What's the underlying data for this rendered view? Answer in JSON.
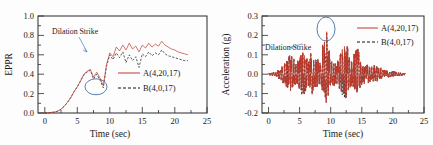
{
  "figure": {
    "panels": [
      {
        "id": "eppr-panel",
        "ylabel": "EPPR",
        "xlabel": "Time (sec)",
        "annotation": "Dilation Strike",
        "yticks": [
          "0.0",
          "0.2",
          "0.4",
          "0.6",
          "0.8",
          "1.0"
        ],
        "xticks": [
          "0",
          "5",
          "10",
          "15",
          "20",
          "25"
        ],
        "legend": [
          {
            "label": "A(4,20,17)",
            "style": "solid",
            "color": "#c0392b"
          },
          {
            "label": "B(4,0,17)",
            "style": "dashed",
            "color": "#111111"
          }
        ]
      },
      {
        "id": "acceleration-panel",
        "ylabel": "Acceleration (g)",
        "xlabel": "Time (sec)",
        "annotation": "Dilation Strike",
        "yticks": [
          "-0.2",
          "-0.1",
          "0.0",
          "0.1",
          "0.2",
          "0.3"
        ],
        "xticks": [
          "0",
          "5",
          "10",
          "15",
          "20",
          "25"
        ],
        "legend": [
          {
            "label": "A(4,20,17)",
            "style": "solid",
            "color": "#c0392b"
          },
          {
            "label": "B(4,0,17)",
            "style": "dashed",
            "color": "#111111"
          }
        ]
      }
    ]
  },
  "chart_data": [
    {
      "type": "line",
      "title": "",
      "xlabel": "Time (sec)",
      "ylabel": "EPPR",
      "xlim": [
        0,
        25
      ],
      "ylim": [
        0.0,
        1.0
      ],
      "xticks": [
        0,
        5,
        10,
        15,
        20,
        25
      ],
      "yticks": [
        0.0,
        0.2,
        0.4,
        0.6,
        0.8,
        1.0
      ],
      "grid": false,
      "legend_position": "center-right",
      "annotations": [
        {
          "text": "Dilation Strike",
          "x": 3.2,
          "y": 0.88,
          "arrow_to_x": 6.0,
          "arrow_to_y": 0.62
        },
        {
          "shape": "ellipse",
          "cx": 9.0,
          "cy": 0.27,
          "rx": 1.5,
          "ry": 0.085
        }
      ],
      "x": [
        0,
        0.5,
        1,
        1.5,
        2,
        2.5,
        3,
        3.5,
        4,
        4.5,
        5,
        5.5,
        6,
        6.5,
        7,
        7.5,
        8,
        8.5,
        9,
        9.5,
        10,
        10.5,
        11,
        11.5,
        12,
        12.5,
        13,
        13.5,
        14,
        14.5,
        15,
        15.5,
        16,
        16.5,
        17,
        17.5,
        18,
        18.5,
        19,
        19.5,
        20,
        20.5,
        21,
        21.5,
        22
      ],
      "series": [
        {
          "name": "A(4,20,17)",
          "style": "solid",
          "color": "#c0392b",
          "values": [
            0.0,
            0.0,
            0.01,
            0.01,
            0.02,
            0.04,
            0.07,
            0.11,
            0.16,
            0.22,
            0.27,
            0.33,
            0.4,
            0.43,
            0.45,
            0.37,
            0.42,
            0.36,
            0.28,
            0.5,
            0.62,
            0.58,
            0.68,
            0.64,
            0.7,
            0.65,
            0.72,
            0.66,
            0.69,
            0.63,
            0.7,
            0.67,
            0.72,
            0.68,
            0.71,
            0.69,
            0.74,
            0.7,
            0.68,
            0.66,
            0.65,
            0.63,
            0.62,
            0.61,
            0.6
          ]
        },
        {
          "name": "B(4,0,17)",
          "style": "dashed",
          "color": "#111111",
          "values": [
            0.0,
            0.0,
            0.01,
            0.01,
            0.02,
            0.04,
            0.07,
            0.11,
            0.16,
            0.22,
            0.27,
            0.33,
            0.39,
            0.42,
            0.44,
            0.35,
            0.4,
            0.34,
            0.26,
            0.48,
            0.6,
            0.55,
            0.62,
            0.57,
            0.63,
            0.52,
            0.6,
            0.54,
            0.58,
            0.47,
            0.61,
            0.58,
            0.63,
            0.59,
            0.62,
            0.6,
            0.65,
            0.61,
            0.59,
            0.58,
            0.57,
            0.56,
            0.55,
            0.54,
            0.54
          ]
        }
      ]
    },
    {
      "type": "line",
      "title": "",
      "xlabel": "Time (sec)",
      "ylabel": "Acceleration (g)",
      "xlim": [
        0,
        25
      ],
      "ylim": [
        -0.2,
        0.3
      ],
      "xticks": [
        0,
        5,
        10,
        15,
        20,
        25
      ],
      "yticks": [
        -0.2,
        -0.1,
        0.0,
        0.1,
        0.2,
        0.3
      ],
      "grid": false,
      "legend_position": "top-right",
      "annotations": [
        {
          "text": "Dilation Strike",
          "x": 1.5,
          "y": 0.155,
          "arrow_to_x": 5.6,
          "arrow_to_y": 0.205
        },
        {
          "shape": "ellipse",
          "cx": 9.2,
          "cy": 0.235,
          "rx": 1.1,
          "ry": 0.052
        }
      ],
      "description": "Dense seismic acceleration time history, ~0.02 s sample spacing, envelope peaking near t=9.3 s at 0.255 g and minimum near t=9.6 s at -0.15 g; motion decays after t=15 s to near zero by t=22 s.",
      "envelope_x": [
        0,
        1,
        2,
        3,
        3.6,
        4.5,
        5.5,
        6.3,
        7,
        7.6,
        8.3,
        9.3,
        10,
        11,
        12.4,
        13.2,
        14.3,
        15.2,
        16.3,
        17.3,
        18.5,
        20,
        22
      ],
      "envelope_peak": [
        0.005,
        0.01,
        0.03,
        0.085,
        0.105,
        0.06,
        0.115,
        0.075,
        0.125,
        0.09,
        0.07,
        0.255,
        0.08,
        0.06,
        0.175,
        0.07,
        0.145,
        0.05,
        0.055,
        0.045,
        0.025,
        0.015,
        0.005
      ],
      "envelope_trough": [
        -0.005,
        -0.01,
        -0.03,
        -0.075,
        -0.09,
        -0.055,
        -0.125,
        -0.07,
        -0.105,
        -0.08,
        -0.065,
        -0.15,
        -0.07,
        -0.055,
        -0.145,
        -0.06,
        -0.105,
        -0.045,
        -0.05,
        -0.04,
        -0.02,
        -0.012,
        -0.005
      ],
      "series": [
        {
          "name": "A(4,20,17)",
          "style": "solid",
          "color": "#c0392b"
        },
        {
          "name": "B(4,0,17)",
          "style": "dashed",
          "color": "#111111"
        }
      ]
    }
  ]
}
